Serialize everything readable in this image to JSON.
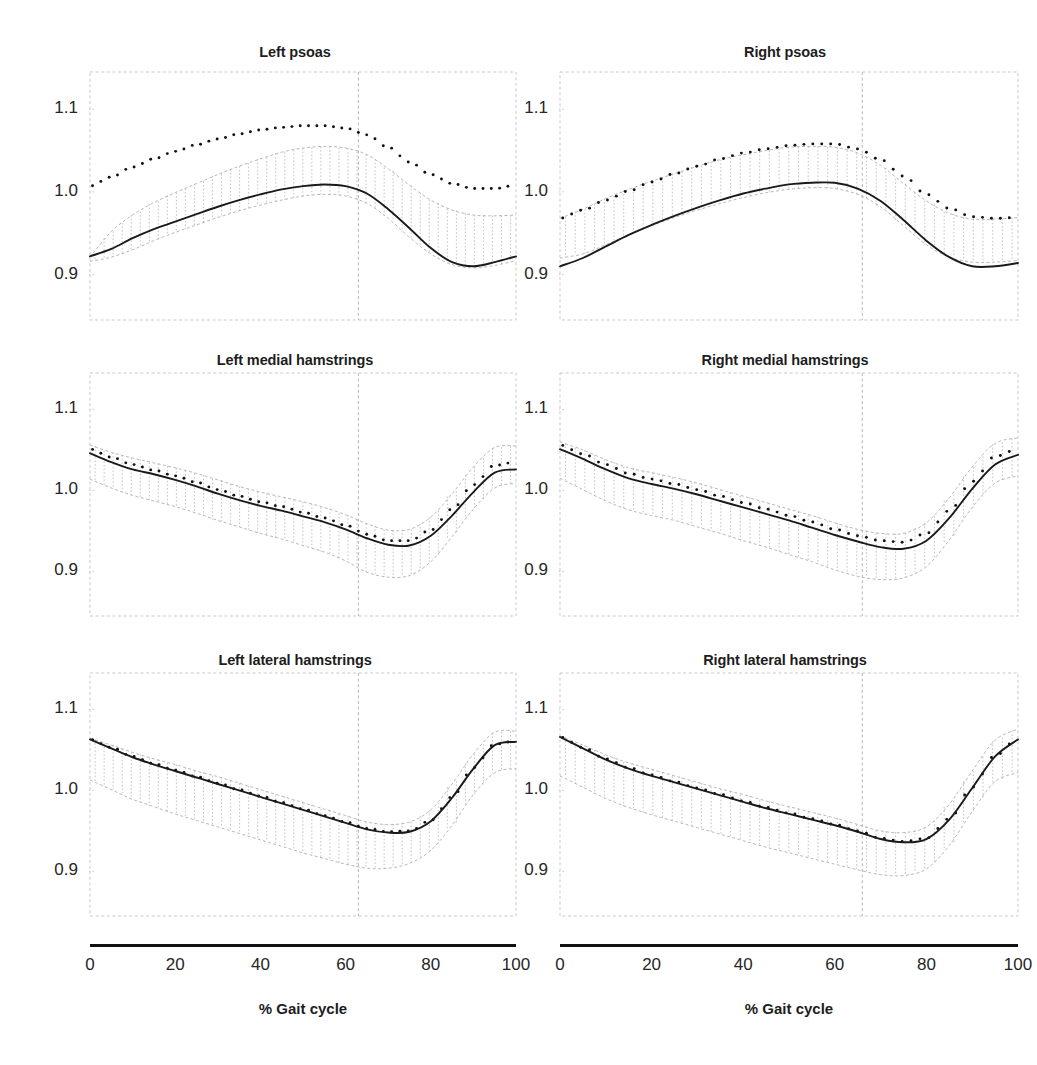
{
  "figure": {
    "background": "#ffffff",
    "width": 1031,
    "height": 1065,
    "series_colors": {
      "mean_line": "#1a1a1a",
      "dotted_line": "#111111",
      "band_hatch": "#b9b9b9",
      "band_edge": "#b0b0b0",
      "gridline": "#c9c9c9",
      "toeoff_line": "#b5b5b5",
      "axis_bar": "#111111"
    },
    "caption_partial": ""
  },
  "axes": {
    "xlabel": "% Gait cycle",
    "xticks": [
      0,
      20,
      40,
      60,
      80,
      100
    ],
    "xticklabels": [
      "0",
      "20",
      "40",
      "60",
      "80",
      "100"
    ],
    "yticks": [
      0.9,
      1.0,
      1.1
    ],
    "yticklabels": [
      "0.9",
      "1.0",
      "1.1"
    ],
    "xlim": [
      0,
      100
    ],
    "ylim": [
      0.845,
      1.145
    ],
    "grid": "dashed box border only"
  },
  "chart_data": {
    "type": "line",
    "title": "",
    "xlabel": "% Gait cycle",
    "ylabel": "",
    "xlim": [
      0,
      100
    ],
    "ylim": [
      0.845,
      1.145
    ],
    "x": [
      0,
      5,
      10,
      15,
      20,
      25,
      30,
      35,
      40,
      45,
      50,
      55,
      60,
      65,
      70,
      75,
      80,
      85,
      90,
      95,
      100
    ],
    "panels": [
      {
        "title": "Left psoas",
        "row": 0,
        "col": 0,
        "toe_off": 63,
        "series": [
          {
            "name": "mean",
            "style": "solid",
            "values": [
              0.922,
              0.931,
              0.944,
              0.955,
              0.964,
              0.973,
              0.982,
              0.99,
              0.997,
              1.003,
              1.007,
              1.009,
              1.007,
              0.998,
              0.979,
              0.956,
              0.932,
              0.915,
              0.91,
              0.915,
              0.922
            ]
          },
          {
            "name": "reference",
            "style": "dotted",
            "values": [
              1.007,
              1.018,
              1.03,
              1.04,
              1.049,
              1.057,
              1.064,
              1.07,
              1.075,
              1.078,
              1.08,
              1.08,
              1.077,
              1.069,
              1.054,
              1.036,
              1.021,
              1.01,
              1.004,
              1.004,
              1.008
            ]
          },
          {
            "name": "band_upper",
            "style": "band",
            "values": [
              0.921,
              0.952,
              0.972,
              0.987,
              0.999,
              1.01,
              1.021,
              1.031,
              1.04,
              1.048,
              1.053,
              1.055,
              1.053,
              1.045,
              1.028,
              1.008,
              0.99,
              0.978,
              0.972,
              0.971,
              0.972
            ]
          },
          {
            "name": "band_lower",
            "style": "band",
            "values": [
              0.916,
              0.921,
              0.93,
              0.941,
              0.951,
              0.96,
              0.969,
              0.977,
              0.984,
              0.99,
              0.995,
              0.997,
              0.995,
              0.986,
              0.968,
              0.945,
              0.925,
              0.912,
              0.908,
              0.911,
              0.917
            ]
          }
        ]
      },
      {
        "title": "Right psoas",
        "row": 0,
        "col": 1,
        "toe_off": 66,
        "series": [
          {
            "name": "mean",
            "style": "solid",
            "values": [
              0.91,
              0.92,
              0.934,
              0.948,
              0.96,
              0.971,
              0.981,
              0.99,
              0.998,
              1.004,
              1.009,
              1.011,
              1.011,
              1.004,
              0.989,
              0.966,
              0.941,
              0.921,
              0.91,
              0.91,
              0.914
            ]
          },
          {
            "name": "reference",
            "style": "dotted",
            "values": [
              0.968,
              0.978,
              0.99,
              1.001,
              1.012,
              1.022,
              1.031,
              1.04,
              1.047,
              1.052,
              1.056,
              1.058,
              1.058,
              1.052,
              1.039,
              1.019,
              0.997,
              0.98,
              0.97,
              0.968,
              0.969
            ]
          },
          {
            "name": "band_upper",
            "style": "band",
            "values": [
              0.968,
              0.979,
              0.992,
              1.003,
              1.013,
              1.022,
              1.031,
              1.039,
              1.045,
              1.05,
              1.054,
              1.055,
              1.054,
              1.047,
              1.032,
              1.01,
              0.989,
              0.974,
              0.967,
              0.967,
              0.969
            ]
          },
          {
            "name": "band_lower",
            "style": "band",
            "values": [
              0.92,
              0.925,
              0.936,
              0.948,
              0.959,
              0.969,
              0.978,
              0.986,
              0.993,
              0.999,
              1.003,
              1.005,
              1.004,
              0.997,
              0.982,
              0.959,
              0.936,
              0.921,
              0.915,
              0.915,
              0.917
            ]
          }
        ]
      },
      {
        "title": "Left medial hamstrings",
        "row": 1,
        "col": 0,
        "toe_off": 63,
        "series": [
          {
            "name": "mean",
            "style": "solid",
            "values": [
              1.046,
              1.035,
              1.026,
              1.02,
              1.013,
              1.005,
              0.996,
              0.988,
              0.981,
              0.975,
              0.968,
              0.961,
              0.952,
              0.941,
              0.933,
              0.932,
              0.944,
              0.969,
              0.998,
              1.022,
              1.026
            ]
          },
          {
            "name": "reference",
            "style": "dotted",
            "values": [
              1.051,
              1.041,
              1.032,
              1.025,
              1.018,
              1.01,
              1.001,
              0.993,
              0.986,
              0.98,
              0.973,
              0.966,
              0.957,
              0.946,
              0.938,
              0.938,
              0.951,
              0.977,
              1.007,
              1.031,
              1.035
            ]
          },
          {
            "name": "band_upper",
            "style": "band",
            "values": [
              1.056,
              1.047,
              1.04,
              1.034,
              1.028,
              1.021,
              1.013,
              1.005,
              0.998,
              0.992,
              0.986,
              0.979,
              0.97,
              0.959,
              0.951,
              0.952,
              0.967,
              0.996,
              1.029,
              1.053,
              1.055
            ]
          },
          {
            "name": "band_lower",
            "style": "band",
            "values": [
              1.014,
              1.003,
              0.994,
              0.987,
              0.98,
              0.972,
              0.963,
              0.955,
              0.947,
              0.94,
              0.932,
              0.924,
              0.913,
              0.899,
              0.893,
              0.895,
              0.912,
              0.943,
              0.977,
              1.003,
              1.009
            ]
          }
        ]
      },
      {
        "title": "Right medial hamstrings",
        "row": 1,
        "col": 1,
        "toe_off": 66,
        "series": [
          {
            "name": "mean",
            "style": "solid",
            "values": [
              1.051,
              1.039,
              1.026,
              1.015,
              1.008,
              1.002,
              0.995,
              0.987,
              0.979,
              0.971,
              0.963,
              0.954,
              0.945,
              0.937,
              0.93,
              0.928,
              0.938,
              0.966,
              1.002,
              1.032,
              1.044
            ]
          },
          {
            "name": "reference",
            "style": "dotted",
            "values": [
              1.056,
              1.045,
              1.032,
              1.021,
              1.014,
              1.008,
              1.001,
              0.993,
              0.985,
              0.977,
              0.969,
              0.961,
              0.952,
              0.944,
              0.938,
              0.936,
              0.947,
              0.975,
              1.011,
              1.042,
              1.051
            ]
          },
          {
            "name": "band_upper",
            "style": "band",
            "values": [
              1.06,
              1.05,
              1.038,
              1.028,
              1.022,
              1.016,
              1.009,
              1.001,
              0.993,
              0.985,
              0.977,
              0.969,
              0.96,
              0.952,
              0.947,
              0.947,
              0.96,
              0.991,
              1.029,
              1.058,
              1.065
            ]
          },
          {
            "name": "band_lower",
            "style": "band",
            "values": [
              1.015,
              1.001,
              0.987,
              0.976,
              0.969,
              0.963,
              0.955,
              0.947,
              0.938,
              0.93,
              0.921,
              0.912,
              0.902,
              0.894,
              0.89,
              0.892,
              0.906,
              0.939,
              0.979,
              1.009,
              1.018
            ]
          }
        ]
      },
      {
        "title": "Left lateral hamstrings",
        "row": 2,
        "col": 0,
        "toe_off": 63,
        "series": [
          {
            "name": "mean",
            "style": "solid",
            "values": [
              1.063,
              1.052,
              1.041,
              1.032,
              1.024,
              1.016,
              1.008,
              1.0,
              0.992,
              0.984,
              0.976,
              0.968,
              0.96,
              0.952,
              0.948,
              0.949,
              0.962,
              0.991,
              1.027,
              1.056,
              1.06
            ]
          },
          {
            "name": "reference",
            "style": "dotted",
            "values": [
              1.063,
              1.053,
              1.042,
              1.033,
              1.025,
              1.017,
              1.009,
              1.001,
              0.993,
              0.985,
              0.977,
              0.969,
              0.961,
              0.953,
              0.949,
              0.95,
              0.963,
              0.992,
              1.028,
              1.057,
              1.061
            ]
          },
          {
            "name": "band_upper",
            "style": "band",
            "values": [
              1.064,
              1.056,
              1.047,
              1.039,
              1.032,
              1.024,
              1.017,
              1.009,
              1.001,
              0.993,
              0.985,
              0.977,
              0.969,
              0.961,
              0.958,
              0.961,
              0.976,
              1.008,
              1.045,
              1.072,
              1.073
            ]
          },
          {
            "name": "band_lower",
            "style": "band",
            "values": [
              1.013,
              1.001,
              0.989,
              0.98,
              0.971,
              0.963,
              0.955,
              0.947,
              0.939,
              0.931,
              0.923,
              0.916,
              0.909,
              0.904,
              0.904,
              0.91,
              0.926,
              0.957,
              0.995,
              1.022,
              1.027
            ]
          }
        ]
      },
      {
        "title": "Right lateral hamstrings",
        "row": 2,
        "col": 1,
        "toe_off": 66,
        "series": [
          {
            "name": "mean",
            "style": "solid",
            "values": [
              1.066,
              1.052,
              1.038,
              1.027,
              1.018,
              1.01,
              1.002,
              0.994,
              0.986,
              0.978,
              0.971,
              0.964,
              0.957,
              0.949,
              0.94,
              0.936,
              0.94,
              0.964,
              1.003,
              1.042,
              1.063
            ]
          },
          {
            "name": "reference",
            "style": "dotted",
            "values": [
              1.066,
              1.053,
              1.039,
              1.028,
              1.019,
              1.011,
              1.003,
              0.995,
              0.987,
              0.979,
              0.972,
              0.965,
              0.958,
              0.95,
              0.941,
              0.937,
              0.941,
              0.965,
              1.004,
              1.043,
              1.064
            ]
          },
          {
            "name": "band_upper",
            "style": "band",
            "values": [
              1.067,
              1.056,
              1.044,
              1.034,
              1.026,
              1.018,
              1.01,
              1.002,
              0.995,
              0.987,
              0.98,
              0.973,
              0.966,
              0.958,
              0.95,
              0.948,
              0.955,
              0.983,
              1.024,
              1.062,
              1.076
            ]
          },
          {
            "name": "band_lower",
            "style": "band",
            "values": [
              1.018,
              1.004,
              0.99,
              0.979,
              0.97,
              0.962,
              0.954,
              0.946,
              0.938,
              0.93,
              0.923,
              0.916,
              0.909,
              0.902,
              0.896,
              0.895,
              0.903,
              0.932,
              0.974,
              1.011,
              1.022
            ]
          }
        ]
      }
    ]
  }
}
